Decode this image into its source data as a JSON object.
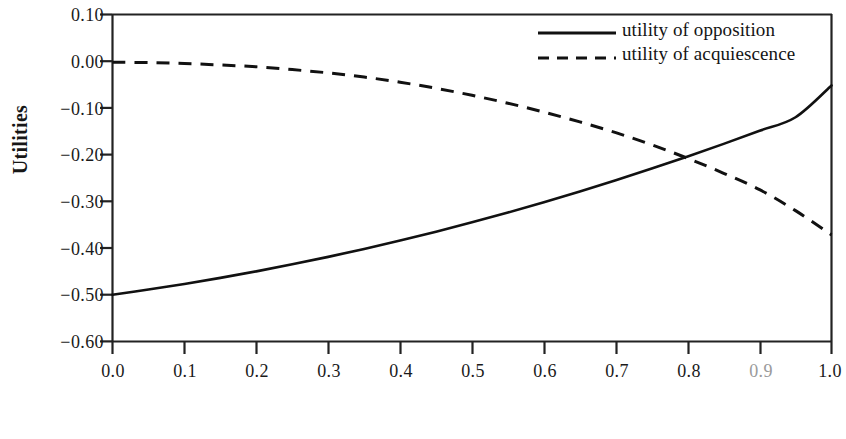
{
  "chart_data": {
    "type": "line",
    "title": "",
    "xlabel": "Proportion of the group choosing opposition",
    "ylabel": "Utilities",
    "xlim": [
      0.0,
      1.0
    ],
    "ylim": [
      -0.6,
      0.1
    ],
    "grid": false,
    "legend_position": "top-right",
    "x_ticks": [
      "0.0",
      "0.1",
      "0.2",
      "0.3",
      "0.4",
      "0.5",
      "0.6",
      "0.7",
      "0.9",
      "1.0"
    ],
    "x_tick_values": [
      0.0,
      0.1,
      0.2,
      0.3,
      0.4,
      0.5,
      0.6,
      0.7,
      0.8,
      0.9,
      1.0
    ],
    "x_tick_labels": [
      "0.0",
      "0.1",
      "0.2",
      "0.3",
      "0.4",
      "0.5",
      "0.6",
      "0.7",
      "0.8",
      "0.9",
      "1.0"
    ],
    "y_ticks": [
      "0.10",
      "0.00",
      "−0.10",
      "−0.20",
      "−0.30",
      "−0.40",
      "−0.50",
      "−0.60"
    ],
    "y_tick_values": [
      0.1,
      0.0,
      -0.1,
      -0.2,
      -0.3,
      -0.4,
      -0.5,
      -0.6
    ],
    "x": [
      0.0,
      0.05,
      0.1,
      0.15,
      0.2,
      0.25,
      0.3,
      0.35,
      0.4,
      0.45,
      0.5,
      0.55,
      0.6,
      0.65,
      0.7,
      0.75,
      0.8,
      0.85,
      0.9,
      0.95,
      1.0
    ],
    "series": [
      {
        "name": "utility of opposition",
        "style": "solid",
        "color": "#111111",
        "values": [
          -0.5,
          -0.489,
          -0.477,
          -0.464,
          -0.45,
          -0.435,
          -0.419,
          -0.402,
          -0.384,
          -0.365,
          -0.345,
          -0.324,
          -0.302,
          -0.279,
          -0.255,
          -0.23,
          -0.204,
          -0.177,
          -0.149,
          -0.12,
          -0.052
        ]
      },
      {
        "name": "utility of acquiescence",
        "style": "dashed",
        "color": "#111111",
        "values": [
          -0.002,
          -0.003,
          -0.005,
          -0.008,
          -0.012,
          -0.018,
          -0.025,
          -0.034,
          -0.045,
          -0.058,
          -0.073,
          -0.09,
          -0.109,
          -0.13,
          -0.153,
          -0.179,
          -0.208,
          -0.24,
          -0.275,
          -0.32,
          -0.372
        ]
      }
    ],
    "intersection": {
      "x": 0.77,
      "y": -0.17
    },
    "annotations": []
  },
  "legend": {
    "entries": [
      {
        "label": "utility of opposition",
        "marker": "solid-line"
      },
      {
        "label": "utility of acquiescence",
        "marker": "dashed-line"
      }
    ]
  }
}
